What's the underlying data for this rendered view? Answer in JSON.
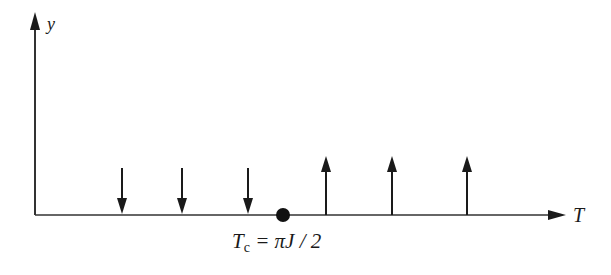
{
  "diagram": {
    "y_axis_label": "y",
    "x_axis_label": "T",
    "critical_point": {
      "label_main": "T",
      "label_sub": "c",
      "label_rest": " = πJ / 2"
    },
    "arrows_below_tc": [
      {
        "direction": "down"
      },
      {
        "direction": "down"
      },
      {
        "direction": "down"
      }
    ],
    "arrows_above_tc": [
      {
        "direction": "up"
      },
      {
        "direction": "up"
      },
      {
        "direction": "up"
      }
    ],
    "colors": {
      "ink": "#1a1a1a"
    }
  }
}
